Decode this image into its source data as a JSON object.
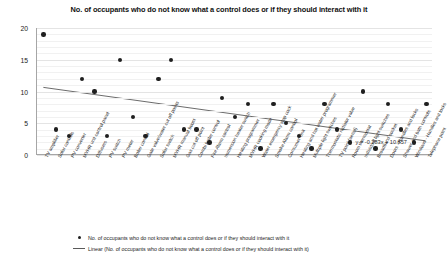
{
  "chart_data": {
    "type": "scatter",
    "title": "No. of occupants who do not know what a control does or if they should interact with it",
    "xlabel": "",
    "ylabel": "",
    "ylim": [
      0,
      20
    ],
    "yticks": [
      0,
      5,
      10,
      15,
      20
    ],
    "grid": true,
    "legend_position": "bottom",
    "categories": [
      "TV amplifier",
      "Solar controls",
      "PV converter",
      "MVHR unit control panel",
      "Diffusers",
      "PV switch",
      "PV meter",
      "Boiler control",
      "Gate valve/water cut off points",
      "Solar switch",
      "MVHR manual boost",
      "Gas cut off point",
      "Combi boiler control",
      "Fire Alarm control",
      "Immersion heater switch",
      "Heating programmer",
      "MVHR cooking mode",
      "Water emergency stop cock",
      "Smoke Alarm control",
      "Consumer Unit",
      "Heating and hot water programmer",
      "Multiple light switches",
      "Thermostatic radiator valve",
      "TV point (aerial)",
      "Room thermostat",
      "Individual light switches",
      "Broadband socket",
      "Doors - Handles and locks",
      "Shower and bath controls",
      "Windows - Handles and locks",
      "Telephone point"
    ],
    "series": [
      {
        "name": "No. of occupants who do not know what a control does or if they should interact with it",
        "values": [
          19,
          4,
          3,
          12,
          10,
          3,
          15,
          6,
          3,
          12,
          15,
          4,
          4,
          2,
          9,
          6,
          8,
          1,
          8,
          5,
          3,
          1,
          8,
          4,
          2,
          10,
          1,
          8,
          4,
          2,
          8
        ]
      }
    ],
    "trendline": {
      "name": "Linear (No. of occupants who do not know what a control does or if they should interact with it)",
      "equation": "y = -0.283x + 10.857",
      "slope": -0.283,
      "intercept": 10.857
    }
  },
  "legend": {
    "items": [
      {
        "marker": "dot",
        "label": "No. of occupants who do not know what a control does or if they should interact with it"
      },
      {
        "marker": "line",
        "label": "Linear (No. of occupants who do not know what a control does or if they should interact with it)"
      }
    ]
  },
  "colors": {
    "point": "#1f1f1f",
    "trendline": "#5a5a5a",
    "gridline": "#e4e4e4",
    "axis": "#a6a6a6",
    "text": "#1a1a1a"
  }
}
